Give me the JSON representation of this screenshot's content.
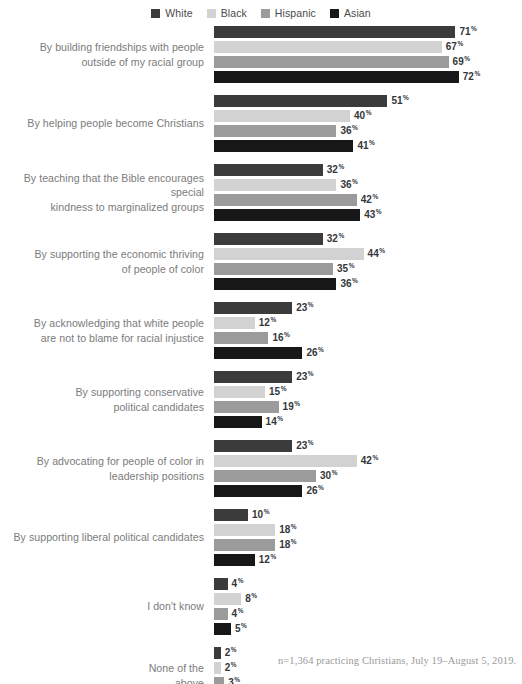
{
  "legend": {
    "items": [
      {
        "label": "White",
        "color": "#3b3b3b"
      },
      {
        "label": "Black",
        "color": "#d2d2d2"
      },
      {
        "label": "Hispanic",
        "color": "#9b9b9b"
      },
      {
        "label": "Asian",
        "color": "#171717"
      }
    ]
  },
  "footnote": "n=1,364 practicing Christians, July 19–August 5, 2019.",
  "chart_data": {
    "type": "bar",
    "orientation": "horizontal",
    "title": "",
    "subtitle": "",
    "xlabel": "",
    "ylabel": "",
    "xlim": [
      0,
      72
    ],
    "grid": false,
    "legend_position": "top-center",
    "value_suffix": "%",
    "categories": [
      "By building friendships with people outside of my racial group",
      "By helping people become Christians",
      "By teaching that the Bible encourages special kindness to marginalized groups",
      "By supporting the economic thriving of people of color",
      "By acknowledging that white people are not to blame for racial injustice",
      "By supporting conservative political candidates",
      "By advocating for people of color in leadership positions",
      "By supporting liberal political candidates",
      "I don't know",
      "None of the above"
    ],
    "category_lines": [
      [
        "By building friendships with people",
        "outside of my racial group"
      ],
      [
        "By helping people become Christians"
      ],
      [
        "By teaching that the Bible encourages special",
        "kindness to marginalized groups"
      ],
      [
        "By supporting the economic thriving",
        "of people of color"
      ],
      [
        "By acknowledging that white people",
        "are not to blame for racial injustice"
      ],
      [
        "By supporting conservative",
        "political candidates"
      ],
      [
        "By advocating for people of color in",
        "leadership positions"
      ],
      [
        "By supporting liberal political candidates"
      ],
      [
        "I don't know"
      ],
      [
        "None of the",
        "above"
      ]
    ],
    "series": [
      {
        "name": "White",
        "color": "#3b3b3b",
        "values": [
          71,
          51,
          32,
          32,
          23,
          23,
          23,
          10,
          4,
          2
        ]
      },
      {
        "name": "Black",
        "color": "#d2d2d2",
        "values": [
          67,
          40,
          36,
          44,
          12,
          15,
          42,
          18,
          8,
          2
        ]
      },
      {
        "name": "Hispanic",
        "color": "#9b9b9b",
        "values": [
          69,
          36,
          42,
          35,
          16,
          19,
          30,
          18,
          4,
          3
        ]
      },
      {
        "name": "Asian",
        "color": "#171717",
        "values": [
          72,
          41,
          43,
          36,
          26,
          14,
          26,
          12,
          5,
          0
        ]
      }
    ]
  }
}
